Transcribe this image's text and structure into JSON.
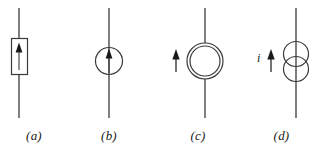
{
  "figure": {
    "background_color": "#ffffff",
    "stroke_color": "#3a3a3a",
    "text_color": "#1a1a1a",
    "width": 317,
    "height": 155
  },
  "symbols": [
    {
      "id": "a",
      "caption": "(a)",
      "shape": "rectangle-with-up-arrow",
      "arrow_direction": "up",
      "arrow_position": "inside",
      "wire": "vertical",
      "label": ""
    },
    {
      "id": "b",
      "caption": "(b)",
      "shape": "circle-with-up-arrow",
      "arrow_direction": "up",
      "arrow_position": "inside",
      "wire": "vertical",
      "label": ""
    },
    {
      "id": "c",
      "caption": "(c)",
      "shape": "double-concentric-circle",
      "arrow_direction": "up",
      "arrow_position": "left",
      "wire": "vertical",
      "label": ""
    },
    {
      "id": "d",
      "caption": "(d)",
      "shape": "two-overlapping-circles",
      "arrow_direction": "up",
      "arrow_position": "left",
      "wire": "vertical",
      "label": "i"
    }
  ]
}
